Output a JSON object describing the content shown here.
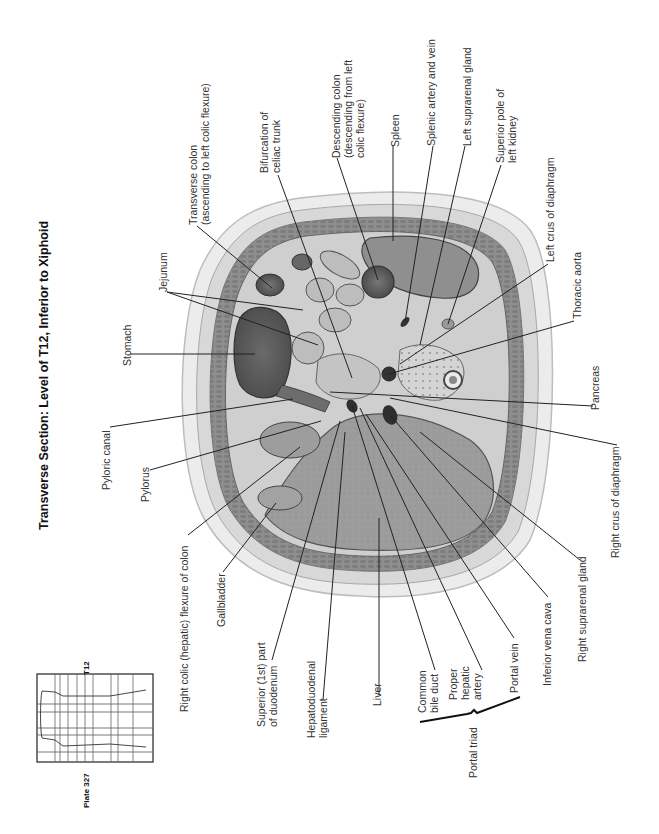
{
  "title": "Transverse Section: Level of T12, Inferior to Xiphoid",
  "plate": "Plate 327",
  "locator": {
    "level_label": "T12"
  },
  "colors": {
    "background": "#ffffff",
    "skin": "#e9e9e9",
    "fat": "#dcdcdc",
    "muscle": "#8c8c8c",
    "liver": "#9a9a9a",
    "spleen": "#8f8f8f",
    "lumen_dark": "#3a3a3a",
    "leader": "#222222"
  },
  "labels": {
    "jejunum": "Jejunum",
    "transverse_colon_1": "Transverse colon",
    "transverse_colon_2": "(ascending to left colic flexure)",
    "bifurcation_1": "Bifurcation of",
    "bifurcation_2": "celiac trunk",
    "descending_colon_1": "Descending colon",
    "descending_colon_2": "(descending from left",
    "descending_colon_3": "colic flexure)",
    "spleen": "Spleen",
    "splenic": "Splenic artery and vein",
    "left_suprarenal": "Left suprarenal gland",
    "superior_pole_1": "Superior pole of",
    "superior_pole_2": "left kidney",
    "left_crus": "Left crus of diaphragm",
    "thoracic_aorta": "Thoracic aorta",
    "pancreas": "Pancreas",
    "right_crus": "Right crus of diaphragm",
    "right_suprarenal": "Right suprarenal gland",
    "ivc": "Inferior vena cava",
    "portal_vein": "Portal vein",
    "hepatic_artery_1": "Proper",
    "hepatic_artery_2": "hepatic",
    "hepatic_artery_3": "artery",
    "bile_duct_1": "Common",
    "bile_duct_2": "bile duct",
    "portal_triad": "Portal triad",
    "liver": "Liver",
    "hepatoduodenal_1": "Hepatoduodenal",
    "hepatoduodenal_2": "ligament",
    "duodenum_1": "Superior (1st) part",
    "duodenum_2": "of duodenum",
    "gallbladder": "Gallbladder",
    "right_colic": "Right colic (hepatic) flexure of colon",
    "pylorus": "Pylorus",
    "pyloric_canal": "Pyloric canal",
    "stomach": "Stomach"
  }
}
